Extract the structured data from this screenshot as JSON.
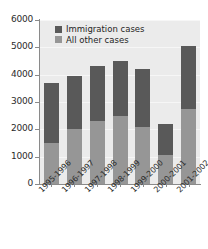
{
  "chart_data": {
    "type": "bar",
    "subtype": "stacked-vertical",
    "title": "",
    "xlabel": "",
    "ylabel": "",
    "ylim": [
      0,
      6000
    ],
    "yticks": [
      0,
      1000,
      2000,
      3000,
      4000,
      5000,
      6000
    ],
    "ytick_labels": [
      "0",
      "1000",
      "2000",
      "3000",
      "4000",
      "5000",
      "6000"
    ],
    "grid": false,
    "legend_position": "top-left-inside",
    "categories": [
      "1995-1996",
      "1996-1997",
      "1997-1998",
      "1998-1999",
      "1999-2000",
      "2000-2001",
      "2001-2002"
    ],
    "series": [
      {
        "name": "All other cases",
        "color": "#969696",
        "values": [
          1500,
          2000,
          2300,
          2500,
          2100,
          1050,
          2750
        ]
      },
      {
        "name": "Immigration cases",
        "color": "#595959",
        "values": [
          2200,
          1950,
          2000,
          2000,
          2100,
          1150,
          2300
        ]
      }
    ],
    "totals": [
      3700,
      3950,
      4300,
      4500,
      4200,
      2200,
      5050
    ],
    "stack_order_bottom_to_top": [
      "All other cases",
      "Immigration cases"
    ]
  },
  "legend": {
    "items": [
      {
        "label": "Immigration cases",
        "color": "#595959"
      },
      {
        "label": "All other cases",
        "color": "#969696"
      }
    ]
  },
  "colors": {
    "immigration": "#595959",
    "other": "#969696",
    "plot_background": "#ebebeb",
    "page_background": "#ffffff",
    "axis": "#8a8a8a",
    "text": "#2b2b2b"
  }
}
